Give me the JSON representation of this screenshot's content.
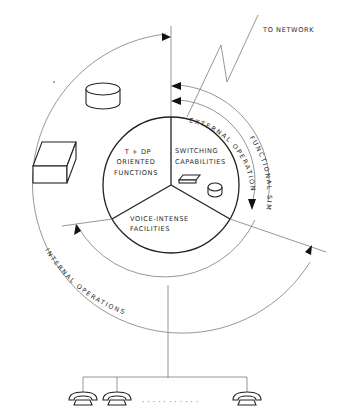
{
  "diagram": {
    "network_label": "TO NETWORK",
    "sectors": [
      {
        "id": "tdp",
        "lines": [
          "T + DP",
          "ORIENTED",
          "FUNCTIONS"
        ]
      },
      {
        "id": "switching",
        "lines": [
          "SWITCHING",
          "CAPABILITIES"
        ]
      },
      {
        "id": "voice",
        "lines": [
          "VOICE-INTENSE",
          "FACILITIES"
        ]
      }
    ],
    "arc_labels": {
      "external_operations": "EXTERNAL OPERATIONS",
      "functional_similarity": "FUNCTIONAL SIMILARITY",
      "internal_operations": "INTERNAL OPERATIONS"
    },
    "icons": [
      "disk-cylinder",
      "box-terminal",
      "small-card",
      "small-disk",
      "telephone",
      "telephone",
      "telephone"
    ],
    "ellipsis": "· · · · · · · · · · ·",
    "colors": {
      "line": "#222222",
      "thin_line": "#6a6a6a",
      "background": "#ffffff"
    }
  }
}
